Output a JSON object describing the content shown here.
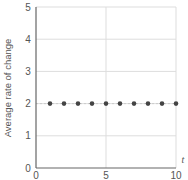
{
  "chart_data": {
    "type": "scatter",
    "title": "",
    "xlabel": "t",
    "ylabel": "Average rate of change",
    "xlim": [
      0,
      10
    ],
    "ylim": [
      0,
      5
    ],
    "x_ticks": [
      0,
      5,
      10
    ],
    "y_ticks": [
      0,
      1,
      2,
      3,
      4,
      5
    ],
    "grid": true,
    "legend": "none",
    "series": [
      {
        "name": "Average rate of change",
        "x": [
          1,
          2,
          3,
          4,
          5,
          6,
          7,
          8,
          9,
          10
        ],
        "y": [
          2,
          2,
          2,
          2,
          2,
          2,
          2,
          2,
          2,
          2
        ],
        "color": "#444444",
        "reference_line": {
          "y": 2,
          "style": "dashed",
          "color": "#cccccc"
        }
      }
    ]
  },
  "colors": {
    "axis": "#666666",
    "grid": "#dddddd",
    "point": "#444444",
    "text": "#555555"
  },
  "labels": {
    "x_title": "t",
    "y_title": "Average rate of change",
    "x_tick_labels": [
      "0",
      "5",
      "10"
    ],
    "y_tick_labels": [
      "0",
      "1",
      "2",
      "3",
      "4",
      "5"
    ]
  }
}
